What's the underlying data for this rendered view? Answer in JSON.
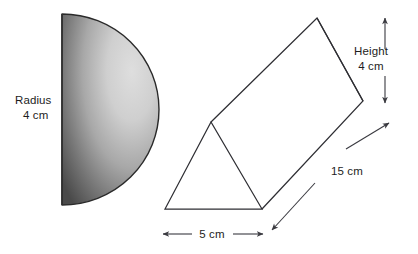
{
  "figure": {
    "background_color": "#ffffff",
    "stroke_color": "#2e2e33",
    "text_color": "#1d1d1d"
  },
  "semicircle": {
    "name": "half-disc",
    "label_line1": "Radius",
    "label_line2": "4 cm",
    "radius_value": "4",
    "units": "cm",
    "fill_light": "#d8d8d8",
    "fill_mid": "#9a9a9a",
    "fill_dark": "#4a4a4a",
    "outline_color": "#2a2a2a"
  },
  "prism": {
    "name": "triangular-prism",
    "height": {
      "label_line1": "Height",
      "label_line2": "4 cm",
      "value": "4",
      "units": "cm"
    },
    "length": {
      "label": "15 cm",
      "value": "15",
      "units": "cm"
    },
    "base": {
      "label": "5 cm",
      "value": "5",
      "units": "cm"
    }
  }
}
